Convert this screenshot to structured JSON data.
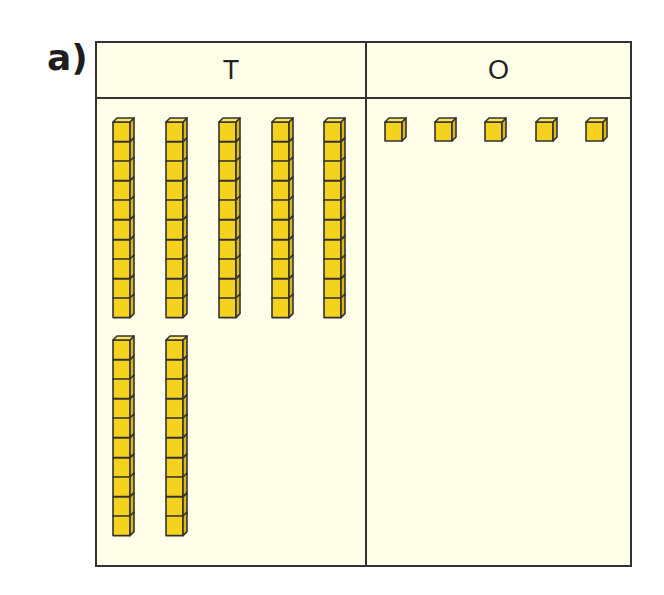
{
  "label": "a)",
  "table": {
    "columns": [
      {
        "header": "T",
        "meaning": "tens"
      },
      {
        "header": "O",
        "meaning": "ones"
      }
    ]
  },
  "blocks": {
    "tens_rods": 7,
    "cubes_per_rod": 10,
    "ones_cubes": 5,
    "represented_number": 75
  },
  "colors": {
    "block_fill": "#f5d21e",
    "block_side": "#e0b814",
    "outline": "#333333",
    "background": "#fffee9"
  },
  "layout": {
    "tens_rows": [
      {
        "top": 117,
        "x": [
          112,
          165,
          218,
          271,
          323
        ]
      },
      {
        "top": 335,
        "x": [
          112,
          165
        ]
      }
    ],
    "ones_row": {
      "top": 117,
      "x": [
        384,
        434,
        484,
        535,
        585
      ]
    }
  }
}
